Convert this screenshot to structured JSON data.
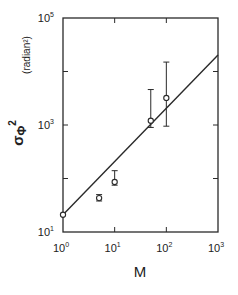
{
  "chart_data": {
    "type": "scatter",
    "title": "",
    "xlabel": "M",
    "ylabel": "σΦ²",
    "ylabel_unit": "(radian²)",
    "xscale": "log",
    "yscale": "log",
    "xlim": [
      1,
      1000
    ],
    "ylim": [
      10,
      100000
    ],
    "x_ticks": [
      {
        "base": "10",
        "exp": "0"
      },
      {
        "base": "10",
        "exp": "1"
      },
      {
        "base": "10",
        "exp": "2"
      },
      {
        "base": "10",
        "exp": "3"
      }
    ],
    "y_ticks": [
      {
        "base": "10",
        "exp": "1"
      },
      {
        "base": "10",
        "exp": "3"
      },
      {
        "base": "10",
        "exp": "5"
      }
    ],
    "grid": false,
    "legend": null,
    "series": [
      {
        "name": "measured",
        "marker": "open-circle",
        "points": [
          {
            "x": 1,
            "y": 21,
            "yerr_low": 21,
            "yerr_high": 21
          },
          {
            "x": 5,
            "y": 43,
            "yerr_low": 38,
            "yerr_high": 50
          },
          {
            "x": 10,
            "y": 86,
            "yerr_low": 75,
            "yerr_high": 140
          },
          {
            "x": 50,
            "y": 1200,
            "yerr_low": 900,
            "yerr_high": 4600
          },
          {
            "x": 100,
            "y": 3200,
            "yerr_low": 950,
            "yerr_high": 15000
          }
        ]
      },
      {
        "name": "fit",
        "style": "line",
        "points": [
          {
            "x": 1,
            "y": 21
          },
          {
            "x": 1000,
            "y": 20400
          }
        ]
      }
    ]
  }
}
